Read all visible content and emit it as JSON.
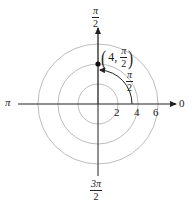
{
  "diagram": {
    "type": "polar-coordinate-plot",
    "axis_labels": {
      "right": "0",
      "top": {
        "num": "π",
        "den": "2"
      },
      "left": "π",
      "bottom": {
        "num": "3π",
        "den": "2"
      }
    },
    "radial_ticks": [
      "2",
      "4",
      "6"
    ],
    "point": {
      "r": "4",
      "theta": {
        "num": "π",
        "den": "2"
      },
      "label_prefix": "4,"
    },
    "angle_arc_label": {
      "num": "π",
      "den": "2"
    },
    "colors": {
      "axis": "#222222",
      "circle": "#bdbdbd",
      "point": "#111111"
    }
  }
}
